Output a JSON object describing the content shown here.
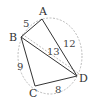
{
  "figure": {
    "type": "cyclic-quadrilateral",
    "vertices": [
      {
        "label": "A",
        "x": 42,
        "y": 19,
        "lx": 42,
        "ly": 15
      },
      {
        "label": "B",
        "x": 21,
        "y": 37,
        "lx": 13,
        "ly": 41
      },
      {
        "label": "C",
        "x": 35,
        "y": 86,
        "lx": 33,
        "ly": 97
      },
      {
        "label": "D",
        "x": 77,
        "y": 76,
        "lx": 84,
        "ly": 82
      }
    ],
    "edges": [
      {
        "from": "A",
        "to": "B",
        "length": "5",
        "lx": 26,
        "ly": 27
      },
      {
        "from": "A",
        "to": "D",
        "length": "12",
        "lx": 68,
        "ly": 47
      },
      {
        "from": "B",
        "to": "D",
        "length": "13",
        "lx": 52,
        "ly": 55
      },
      {
        "from": "B",
        "to": "C",
        "length": "9",
        "lx": 20,
        "ly": 69
      },
      {
        "from": "C",
        "to": "D",
        "length": "8",
        "lx": 58,
        "ly": 93
      }
    ],
    "circle": {
      "cx": 50,
      "cy": 56,
      "rx": 33,
      "ry": 38,
      "style": "dashed"
    },
    "colors": {
      "line": "#333333",
      "dashed": "#999999"
    }
  }
}
